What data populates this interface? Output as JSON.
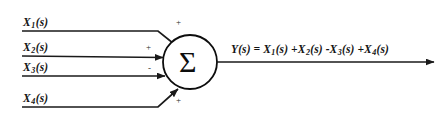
{
  "diagram": {
    "type": "summing-junction-block-diagram",
    "stroke_color": "#1a1a1a",
    "text_color": "#141414",
    "background": "#ffffff",
    "junction": {
      "symbol": "Σ",
      "name": "summing-junction",
      "center_x": 190,
      "center_y": 62,
      "radius": 27
    },
    "inputs": [
      {
        "label_x": "X",
        "label_sub": "1",
        "label_suffix": "(s)",
        "sign": "+",
        "line_y": 31,
        "text": "X1(s)"
      },
      {
        "label_x": "X",
        "label_sub": "2",
        "label_suffix": "(s)",
        "sign": "+",
        "line_y": 56,
        "text": "X2(s)"
      },
      {
        "label_x": "X",
        "label_sub": "3",
        "label_suffix": "(s)",
        "sign": "-",
        "line_y": 76,
        "text": "X3(s)"
      },
      {
        "label_x": "X",
        "label_sub": "4",
        "label_suffix": "(s)",
        "sign": "+",
        "line_y": 107,
        "text": "X4(s)"
      }
    ],
    "output": {
      "y_label": "Y",
      "y_suffix": "(s)",
      "equals": "=",
      "terms": [
        {
          "op": "",
          "x": "X",
          "sub": "1",
          "suffix": "(s)"
        },
        {
          "op": "+",
          "x": "X",
          "sub": "2",
          "suffix": "(s)"
        },
        {
          "op": "-",
          "x": "X",
          "sub": "3",
          "suffix": "(s)"
        },
        {
          "op": "+",
          "x": "X",
          "sub": "4",
          "suffix": "(s)"
        }
      ],
      "equation_text": "Y(s) = X1(s) + X2(s) - X3(s) + X4(s)",
      "line_y": 62
    }
  }
}
